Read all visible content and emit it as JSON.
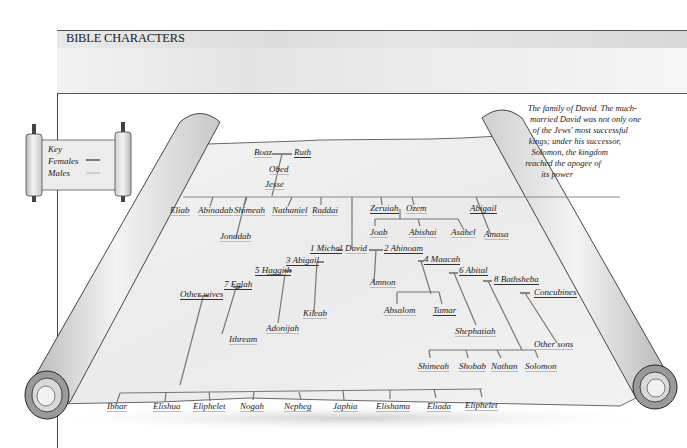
{
  "header": {
    "title": "BIBLE CHARACTERS"
  },
  "key": {
    "title": "Key",
    "items": [
      {
        "label": "Females",
        "line_color": "#333333"
      },
      {
        "label": "Males",
        "line_color": "#bbbbbb"
      }
    ]
  },
  "caption": {
    "lines": [
      "The family of David. The much-",
      "married David was not only one",
      "of  the Jews' most successful",
      "kings; under his successor,",
      "Solomon, the kingdom",
      "reached the apogee of",
      "its power"
    ]
  },
  "tree": {
    "boaz": "Boaz",
    "ruth": "Ruth",
    "obed": "Obed",
    "jesse": "Jesse",
    "jesse_children": [
      "Eliab",
      "Abinadab",
      "Shimeah",
      "Nathaniel",
      "Raddai"
    ],
    "jonadab": "Jonadab",
    "zeruiah": "Zeruiah",
    "ozem": "Ozem",
    "abigail_sister": "Abigail",
    "zeruiah_sons": [
      "Joab",
      "Abishai",
      "Asahel"
    ],
    "amasa": "Amasa",
    "david": "David",
    "wives": {
      "michal": "1 Michal",
      "ahinoam": "2 Ahinoam",
      "abigail": "3 Abigail",
      "maacah": "4 Maacah",
      "haggith": "5 Haggith",
      "abital": "6 Abital",
      "eglah": "7 Eglah",
      "bathsheba": "8 Bathsheba",
      "concubines": "Concubines",
      "other_wives": "Other wives"
    },
    "children": {
      "amnon": "Amnon",
      "absalom": "Absalom",
      "tamar": "Tamar",
      "kileab": "Kileab",
      "adonijah": "Adonijah",
      "ithream": "Ithream",
      "shephatiah": "Shephatiah",
      "other_sons": "Other sons",
      "bathsheba_sons": [
        "Shimeah",
        "Shobab",
        "Nathan",
        "Solomon"
      ],
      "other_wives_sons": [
        "Ibhar",
        "Elishua",
        "Eliphelet",
        "Nogah",
        "Nepheg",
        "Japhia",
        "Elishama",
        "Eliada",
        "Eliphelet"
      ]
    }
  }
}
